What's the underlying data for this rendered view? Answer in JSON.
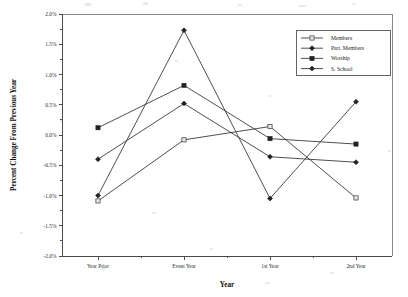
{
  "chart_data": {
    "type": "line",
    "title": "",
    "xlabel": "Year",
    "ylabel": "Percent Change From Previous Year",
    "categories": [
      "Year Prior",
      "Event Year",
      "1st Year",
      "2nd Year"
    ],
    "ylim": [
      -2.0,
      2.0
    ],
    "ytick_values": [
      2.0,
      1.5,
      1.0,
      0.5,
      0.0,
      -0.5,
      -1.0,
      -1.5,
      -2.0
    ],
    "ytick_labels": [
      "2.0%",
      "1.5%",
      "1.0%",
      "0.5%",
      "0.0%",
      "-0.5%",
      "-1.0%",
      "-1.5%",
      "-2.0%"
    ],
    "grid": false,
    "legend_position": "top-right",
    "series": [
      {
        "name": "Members",
        "marker": "open-square",
        "values": [
          -1.09,
          -0.08,
          0.14,
          -1.04
        ]
      },
      {
        "name": "Part. Members",
        "marker": "filled-diamond",
        "values": [
          -0.4,
          0.52,
          -0.36,
          -0.45
        ]
      },
      {
        "name": "Worship",
        "marker": "filled-square",
        "values": [
          0.12,
          0.82,
          -0.06,
          -0.15
        ]
      },
      {
        "name": "S. School",
        "marker": "filled-diamond",
        "values": [
          -1.0,
          1.73,
          -1.05,
          0.55
        ]
      }
    ]
  },
  "legend": {
    "entries": [
      {
        "label": "Members"
      },
      {
        "label": "Part. Members"
      },
      {
        "label": "Worship"
      },
      {
        "label": "S. School"
      }
    ]
  },
  "axes": {
    "x_title": "Year",
    "y_title": "Percent Change From Previous Year"
  },
  "colors": {
    "line": "#2f2f2f",
    "marker_fill": "#222222",
    "marker_open_fill": "#e8e8e8",
    "frame": "#8a8a8a",
    "axis": "#4a4a4a",
    "text": "#1a1a1a",
    "background": "#ffffff"
  }
}
